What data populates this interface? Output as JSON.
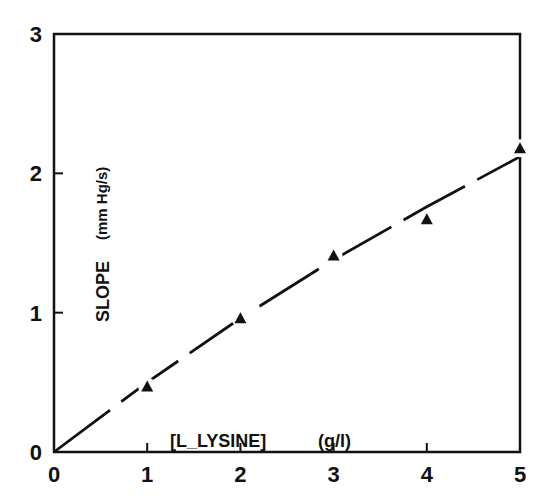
{
  "chart_data": {
    "type": "scatter",
    "title": "",
    "xlabel": "[L_LYSINE]",
    "xlabel_unit": "(g/l)",
    "ylabel": "SLOPE",
    "ylabel_unit": "(mm Hg/s)",
    "xlim": [
      0,
      5
    ],
    "ylim": [
      0,
      3
    ],
    "x_ticks": [
      "0",
      "1",
      "2",
      "3",
      "4",
      "5"
    ],
    "y_ticks": [
      "0",
      "1",
      "2",
      "3"
    ],
    "grid": false,
    "legend": null,
    "series": [
      {
        "name": "measured",
        "marker": "filled-triangle",
        "x": [
          1,
          2,
          3,
          4,
          5
        ],
        "y": [
          0.47,
          0.96,
          1.41,
          1.67,
          2.18
        ]
      },
      {
        "name": "fit",
        "style": "dashed-line",
        "x": [
          0,
          1,
          2,
          3,
          4,
          5
        ],
        "y": [
          0,
          0.5,
          0.96,
          1.38,
          1.76,
          2.12
        ]
      }
    ]
  },
  "axes": {
    "x_title": "[L_LYSINE]",
    "x_unit": "(g/l)",
    "y_title": "SLOPE",
    "y_unit": "(mm Hg/s)"
  }
}
